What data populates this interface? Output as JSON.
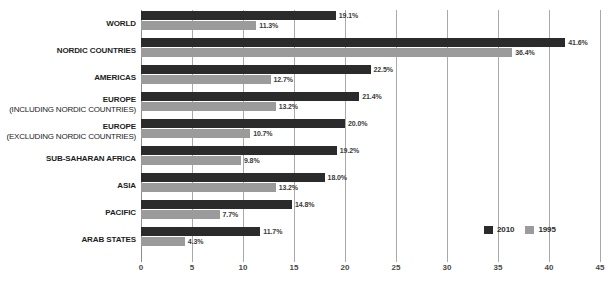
{
  "chart_data": {
    "type": "bar",
    "orientation": "horizontal",
    "title": "",
    "xlabel": "",
    "ylabel": "",
    "xlim": [
      0,
      45
    ],
    "xticks": [
      0,
      5,
      10,
      15,
      20,
      25,
      30,
      35,
      40,
      45
    ],
    "xtick_labels": [
      "0",
      "5",
      "10",
      "15",
      "20",
      "25",
      "30",
      "35",
      "40",
      "45"
    ],
    "grid": true,
    "value_suffix": "%",
    "legend_position": "bottom-right",
    "categories": [
      "WORLD",
      "NORDIC COUNTRIES",
      "AMERICAS",
      "EUROPE",
      "EUROPE",
      "SUB-SAHARAN AFRICA",
      "ASIA",
      "PACIFIC",
      "ARAB STATES"
    ],
    "category_sublabels": [
      "",
      "",
      "",
      "(INCLUDING NORDIC COUNTRIES)",
      "(EXCLUDING NORDIC COUNTRIES)",
      "",
      "",
      "",
      ""
    ],
    "series": [
      {
        "name": "2010",
        "color": "#2b2b2b",
        "values": [
          19.1,
          41.6,
          22.5,
          21.4,
          20.0,
          19.2,
          18.0,
          14.8,
          11.7
        ],
        "value_labels": [
          "19.1%",
          "41.6%",
          "22.5%",
          "21.4%",
          "20.0%",
          "19.2%",
          "18.0%",
          "14.8%",
          "11.7%"
        ]
      },
      {
        "name": "1995",
        "color": "#9b9b9b",
        "values": [
          11.3,
          36.4,
          12.7,
          13.2,
          10.7,
          9.8,
          13.2,
          7.7,
          4.3
        ],
        "value_labels": [
          "11.3%",
          "36.4%",
          "12.7%",
          "13.2%",
          "10.7%",
          "9.8%",
          "13.2%",
          "7.7%",
          "4.3%"
        ]
      }
    ],
    "legend": [
      {
        "label": "2010",
        "color": "#2b2b2b"
      },
      {
        "label": "1995",
        "color": "#9b9b9b"
      }
    ]
  }
}
